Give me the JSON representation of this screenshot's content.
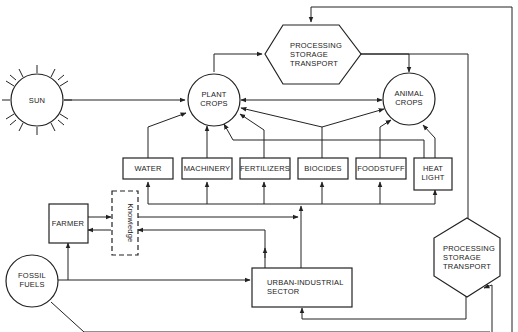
{
  "diagram": {
    "nodes": {
      "sun": {
        "label": "SUN"
      },
      "plant_crops": {
        "line1": "PLANT",
        "line2": "CROPS"
      },
      "animal_crops": {
        "line1": "ANIMAL",
        "line2": "CROPS"
      },
      "pst_top": {
        "line1": "PROCESSING",
        "line2": "STORAGE",
        "line3": "TRANSPORT"
      },
      "pst_right": {
        "line1": "PROCESSING",
        "line2": "STORAGE",
        "line3": "TRANSPORT"
      },
      "water": {
        "label": "WATER"
      },
      "machinery": {
        "label": "MACHINERY"
      },
      "fertilizers": {
        "label": "FERTILIZERS"
      },
      "biocides": {
        "label": "BIOCIDES"
      },
      "foodstuff": {
        "label": "FOODSTUFF"
      },
      "heat_light": {
        "line1": "HEAT",
        "line2": "LIGHT"
      },
      "farmer": {
        "label": "FARMER"
      },
      "knowledge": {
        "label": "Knowledge"
      },
      "fossil_fuels": {
        "line1": "FOSSIL",
        "line2": "FUELS"
      },
      "urban_industrial": {
        "line1": "URBAN-INDUSTRIAL",
        "line2": "SECTOR"
      }
    },
    "edges": [
      {
        "from": "SUN",
        "to": "PLANT CROPS"
      },
      {
        "from": "PLANT CROPS",
        "to": "PROCESSING STORAGE TRANSPORT (top)"
      },
      {
        "from": "PROCESSING STORAGE TRANSPORT (top)",
        "to": "ANIMAL CROPS"
      },
      {
        "from": "PLANT CROPS",
        "to": "ANIMAL CROPS",
        "bidirectional": true
      },
      {
        "from": "WATER",
        "to": "PLANT CROPS"
      },
      {
        "from": "MACHINERY",
        "to": "PLANT CROPS"
      },
      {
        "from": "FERTILIZERS",
        "to": "PLANT CROPS"
      },
      {
        "from": "BIOCIDES",
        "to": "PLANT CROPS"
      },
      {
        "from": "BIOCIDES",
        "to": "ANIMAL CROPS"
      },
      {
        "from": "FOODSTUFF",
        "to": "ANIMAL CROPS"
      },
      {
        "from": "HEAT LIGHT",
        "to": "ANIMAL CROPS"
      },
      {
        "from": "HEAT LIGHT",
        "to": "PLANT CROPS"
      },
      {
        "from": "FARMER",
        "to": "Knowledge"
      },
      {
        "from": "Knowledge",
        "to": "FARMER"
      },
      {
        "from": "Knowledge",
        "to": "inputs bus"
      },
      {
        "from": "URBAN-INDUSTRIAL SECTOR",
        "to": "Knowledge"
      },
      {
        "from": "URBAN-INDUSTRIAL SECTOR",
        "to": "inputs bus"
      },
      {
        "from": "FOSSIL FUELS",
        "to": "FARMER"
      },
      {
        "from": "FOSSIL FUELS",
        "to": "URBAN-INDUSTRIAL SECTOR"
      },
      {
        "from": "FOSSIL FUELS",
        "to": "PROCESSING STORAGE TRANSPORT (right)"
      },
      {
        "from": "PROCESSING STORAGE TRANSPORT (right)",
        "to": "URBAN-INDUSTRIAL SECTOR"
      },
      {
        "from": "PROCESSING STORAGE TRANSPORT (right)",
        "to": "PROCESSING STORAGE TRANSPORT (top)"
      },
      {
        "from": "PROCESSING STORAGE TRANSPORT (top)",
        "to": "PROCESSING STORAGE TRANSPORT (right)"
      }
    ]
  }
}
